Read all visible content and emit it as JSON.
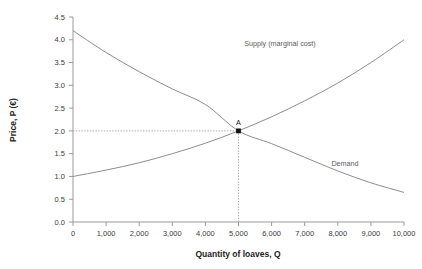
{
  "chart_data": {
    "type": "line",
    "title": "",
    "xlabel": "Quantity of loaves, Q",
    "ylabel": "Price, P (€)",
    "xlim": [
      0,
      10000
    ],
    "ylim": [
      0,
      4.5
    ],
    "grid": false,
    "legend_position": "inline-labels",
    "x_ticks": [
      "0",
      "1,000",
      "2,000",
      "3,000",
      "4,000",
      "5,000",
      "6,000",
      "7,000",
      "8,000",
      "9,000",
      "10,000"
    ],
    "x_tick_values": [
      0,
      1000,
      2000,
      3000,
      4000,
      5000,
      6000,
      7000,
      8000,
      9000,
      10000
    ],
    "y_ticks": [
      "0.0",
      "0.5",
      "1.0",
      "1.5",
      "2.0",
      "2.5",
      "3.0",
      "3.5",
      "4.0",
      "4.5"
    ],
    "y_tick_values": [
      0,
      0.5,
      1.0,
      1.5,
      2.0,
      2.5,
      3.0,
      3.5,
      4.0,
      4.5
    ],
    "series": [
      {
        "name": "Supply (marginal cost)",
        "label": "Supply (marginal cost)",
        "color": "#8d8d8d",
        "x": [
          0,
          1000,
          2000,
          3000,
          4000,
          5000,
          6000,
          7000,
          8000,
          9000,
          10000
        ],
        "values": [
          1.0,
          1.14,
          1.3,
          1.5,
          1.73,
          2.0,
          2.31,
          2.66,
          3.05,
          3.5,
          4.0
        ]
      },
      {
        "name": "Demand",
        "label": "Demand",
        "color": "#8d8d8d",
        "x": [
          0,
          1000,
          2000,
          3000,
          4000,
          5000,
          6000,
          7000,
          8000,
          9000,
          10000
        ],
        "values": [
          4.2,
          3.72,
          3.3,
          2.92,
          2.58,
          2.0,
          1.72,
          1.42,
          1.12,
          0.86,
          0.65
        ]
      }
    ],
    "annotations": [
      {
        "label": "A",
        "x": 5000,
        "y": 2.0,
        "marker": "square",
        "guide_lines": [
          "horizontal-to-y-axis",
          "vertical-to-x-axis"
        ]
      }
    ]
  },
  "series_label_positions": [
    {
      "key": "supply",
      "x": 280,
      "y": 46
    },
    {
      "key": "demand",
      "x": 345,
      "y": 166
    }
  ]
}
